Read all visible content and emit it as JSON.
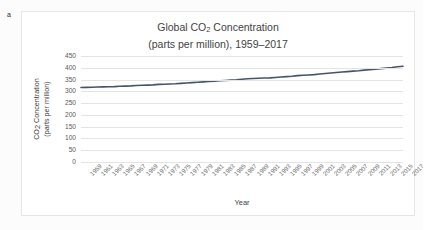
{
  "panel": {
    "label": "a"
  },
  "chart_data": {
    "type": "line",
    "title_line1": "Global CO₂ Concentration",
    "title_line1_pre": "Global CO",
    "title_line1_sub": "2",
    "title_line1_post": " Concentration",
    "title_line2": "(parts per million), 1959–2017",
    "xlabel": "Year",
    "ylabel_line1_pre": "CO",
    "ylabel_line1_sub": "2",
    "ylabel_line1_post": " Concentration",
    "ylabel_line2": "(parts per million)",
    "ylim": [
      0,
      450
    ],
    "yticks": [
      0,
      50,
      100,
      150,
      200,
      250,
      300,
      350,
      400,
      450
    ],
    "grid": true,
    "legend": "none",
    "line_color": "#44546A",
    "xlim": [
      1959,
      2017
    ],
    "xtick_labels": [
      "1959",
      "1961",
      "1963",
      "1965",
      "1967",
      "1969",
      "1971",
      "1973",
      "1975",
      "1977",
      "1979",
      "1981",
      "1983",
      "1985",
      "1987",
      "1989",
      "1991",
      "1993",
      "1995",
      "1997",
      "1999",
      "2001",
      "2003",
      "2005",
      "2007",
      "2009",
      "2011",
      "2013",
      "2015",
      "2017"
    ],
    "x": [
      1959,
      1960,
      1961,
      1962,
      1963,
      1964,
      1965,
      1966,
      1967,
      1968,
      1969,
      1970,
      1971,
      1972,
      1973,
      1974,
      1975,
      1976,
      1977,
      1978,
      1979,
      1980,
      1981,
      1982,
      1983,
      1984,
      1985,
      1986,
      1987,
      1988,
      1989,
      1990,
      1991,
      1992,
      1993,
      1994,
      1995,
      1996,
      1997,
      1998,
      1999,
      2000,
      2001,
      2002,
      2003,
      2004,
      2005,
      2006,
      2007,
      2008,
      2009,
      2010,
      2011,
      2012,
      2013,
      2014,
      2015,
      2016,
      2017
    ],
    "series": [
      {
        "name": "Global CO2 Concentration (ppm)",
        "values": [
          315.97,
          316.91,
          317.64,
          318.45,
          318.99,
          319.62,
          320.04,
          321.38,
          322.16,
          323.04,
          324.62,
          325.68,
          326.32,
          327.45,
          329.68,
          330.18,
          331.11,
          332.04,
          333.83,
          335.4,
          336.84,
          338.75,
          340.11,
          341.45,
          343.05,
          344.65,
          346.12,
          347.42,
          349.19,
          351.57,
          353.12,
          354.39,
          355.61,
          356.45,
          357.1,
          358.83,
          360.82,
          362.61,
          363.73,
          366.7,
          368.38,
          369.55,
          371.14,
          373.28,
          375.8,
          377.52,
          379.8,
          381.9,
          383.79,
          385.6,
          387.43,
          389.9,
          391.65,
          393.85,
          396.52,
          398.65,
          400.83,
          404.24,
          406.55
        ]
      }
    ]
  }
}
